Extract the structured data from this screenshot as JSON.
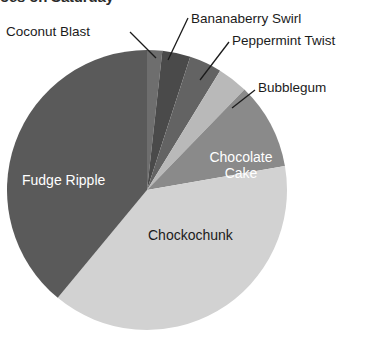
{
  "chart_data": {
    "type": "pie",
    "title": "oes on Saturday",
    "title_note": "title cropped at top edge of screenshot",
    "xlabel": "",
    "ylabel": "",
    "legend_position": "none",
    "grid": false,
    "labels_style": "inline-and-leader-lines",
    "center": {
      "x": 147,
      "y": 190
    },
    "radius": 140,
    "start_angle_deg": 0,
    "direction": "clockwise",
    "categories": [
      "Coconut Blast",
      "Bananaberry Swirl",
      "Peppermint Twist",
      "Bubblegum",
      "Chocolate Cake",
      "Chockochunk",
      "Fudge Ripple"
    ],
    "values": [
      7,
      13,
      15,
      14,
      40,
      155,
      156
    ],
    "value_unit": "degrees",
    "percentages": [
      1.9,
      3.6,
      4.2,
      3.9,
      11.1,
      43.1,
      43.3
    ],
    "colors": [
      "#6e6e6e",
      "#4a4a4a",
      "#636363",
      "#b9b9b9",
      "#8a8a8a",
      "#d2d2d2",
      "#5a5a5a"
    ],
    "slices": [
      {
        "name": "Coconut Blast",
        "angle_deg": 7,
        "color": "#6e6e6e",
        "label_placement": "leader-line",
        "label_text": "Coconut Blast",
        "text_color": "#1b1b1b"
      },
      {
        "name": "Bananaberry Swirl",
        "angle_deg": 13,
        "color": "#4a4a4a",
        "label_placement": "leader-line",
        "label_text": "Bananaberry Swirl",
        "text_color": "#1b1b1b"
      },
      {
        "name": "Peppermint Twist",
        "angle_deg": 15,
        "color": "#636363",
        "label_placement": "leader-line",
        "label_text": "Peppermint Twist",
        "text_color": "#1b1b1b"
      },
      {
        "name": "Bubblegum",
        "angle_deg": 14,
        "color": "#b9b9b9",
        "label_placement": "leader-line",
        "label_text": "Bubblegum",
        "text_color": "#1b1b1b"
      },
      {
        "name": "Chocolate Cake",
        "angle_deg": 40,
        "color": "#8a8a8a",
        "label_placement": "inline",
        "label_text": "Chocolate Cake",
        "label_line1": "Chocolate",
        "label_line2": "Cake",
        "text_color": "#ffffff"
      },
      {
        "name": "Chockochunk",
        "angle_deg": 155,
        "color": "#d2d2d2",
        "label_placement": "inline",
        "label_text": "Chockochunk",
        "text_color": "#1b1b1b"
      },
      {
        "name": "Fudge Ripple",
        "angle_deg": 156,
        "color": "#5a5a5a",
        "label_placement": "inline",
        "label_text": "Fudge Ripple",
        "text_color": "#ffffff"
      }
    ]
  },
  "labels": {
    "coconut_blast": "Coconut Blast",
    "bananaberry_swirl": "Bananaberry Swirl",
    "peppermint_twist": "Peppermint Twist",
    "bubblegum": "Bubblegum",
    "fudge_ripple": "Fudge Ripple",
    "chocolate_cake_line1": "Chocolate",
    "chocolate_cake_line2": "Cake",
    "chockochunk": "Chockochunk"
  },
  "title": "oes on Saturday"
}
